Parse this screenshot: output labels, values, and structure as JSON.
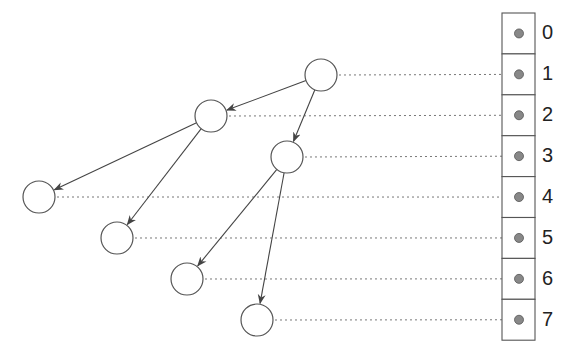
{
  "diagram": {
    "array": {
      "indices": [
        "0",
        "1",
        "2",
        "3",
        "4",
        "5",
        "6",
        "7"
      ],
      "cell_colors": {
        "border": "#555555",
        "dot": "#888888"
      }
    },
    "nodes": [
      {
        "id": "n1",
        "slot": 1,
        "cx": 321,
        "cy": 75
      },
      {
        "id": "n2",
        "slot": 2,
        "cx": 211,
        "cy": 116
      },
      {
        "id": "n3",
        "slot": 3,
        "cx": 287,
        "cy": 157
      },
      {
        "id": "n4",
        "slot": 4,
        "cx": 39,
        "cy": 197
      },
      {
        "id": "n5",
        "slot": 5,
        "cx": 117,
        "cy": 238
      },
      {
        "id": "n6",
        "slot": 6,
        "cx": 187,
        "cy": 279
      },
      {
        "id": "n7",
        "slot": 7,
        "cx": 257,
        "cy": 320
      }
    ],
    "edges": [
      {
        "from": "n1",
        "to": "n2"
      },
      {
        "from": "n1",
        "to": "n3"
      },
      {
        "from": "n2",
        "to": "n4"
      },
      {
        "from": "n2",
        "to": "n5"
      },
      {
        "from": "n3",
        "to": "n6"
      },
      {
        "from": "n3",
        "to": "n7"
      }
    ]
  }
}
